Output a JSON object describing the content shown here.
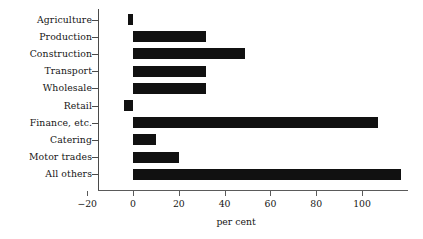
{
  "chart_data": {
    "type": "bar",
    "orientation": "horizontal",
    "title": "",
    "subtitle": "",
    "xlabel": "per cent",
    "ylabel": "",
    "categories": [
      "Agriculture",
      "Production",
      "Construction",
      "Transport",
      "Wholesale",
      "Retail",
      "Finance, etc.",
      "Catering",
      "Motor trades",
      "All others"
    ],
    "values": [
      -2,
      32,
      49,
      32,
      32,
      -4,
      107,
      10,
      20,
      117
    ],
    "xlim": [
      -20,
      120
    ],
    "xticks": [
      -20,
      0,
      20,
      40,
      60,
      80,
      100
    ],
    "xticklabels": [
      "−20",
      "0",
      "20",
      "40",
      "60",
      "80",
      "100"
    ],
    "grid": false,
    "legend": false,
    "bar_color": "#111111",
    "background_color": "#ffffff",
    "axis_color": "#4a4a4a"
  }
}
